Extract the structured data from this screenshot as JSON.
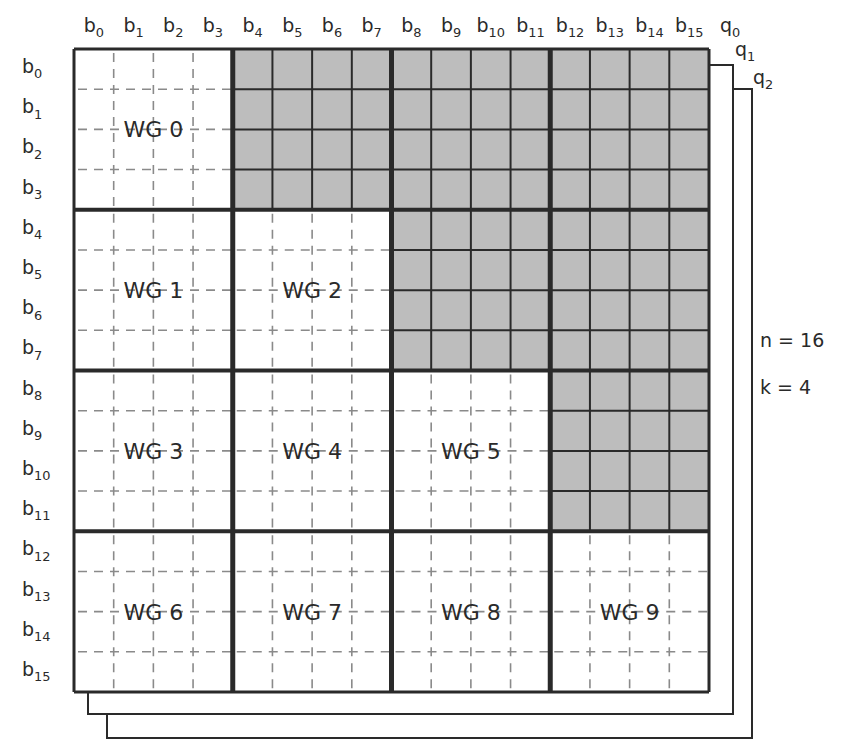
{
  "diagram": {
    "n": 16,
    "k": 4,
    "params": {
      "n_label": "n = 16",
      "k_label": "k = 4"
    },
    "column_labels": [
      "b0",
      "b1",
      "b2",
      "b3",
      "b4",
      "b5",
      "b6",
      "b7",
      "b8",
      "b9",
      "b10",
      "b11",
      "b12",
      "b13",
      "b14",
      "b15"
    ],
    "row_labels": [
      "b0",
      "b1",
      "b2",
      "b3",
      "b4",
      "b5",
      "b6",
      "b7",
      "b8",
      "b9",
      "b10",
      "b11",
      "b12",
      "b13",
      "b14",
      "b15"
    ],
    "layers": [
      {
        "label": "q0",
        "sub": "0"
      },
      {
        "label": "q1",
        "sub": "1"
      },
      {
        "label": "q2",
        "sub": "2"
      }
    ],
    "workgroups": [
      {
        "label": "WG 0",
        "block_row": 0,
        "block_col": 0
      },
      {
        "label": "WG 1",
        "block_row": 1,
        "block_col": 0
      },
      {
        "label": "WG 2",
        "block_row": 1,
        "block_col": 1
      },
      {
        "label": "WG 3",
        "block_row": 2,
        "block_col": 0
      },
      {
        "label": "WG 4",
        "block_row": 2,
        "block_col": 1
      },
      {
        "label": "WG 5",
        "block_row": 2,
        "block_col": 2
      },
      {
        "label": "WG 6",
        "block_row": 3,
        "block_col": 0
      },
      {
        "label": "WG 7",
        "block_row": 3,
        "block_col": 1
      },
      {
        "label": "WG 8",
        "block_row": 3,
        "block_col": 2
      },
      {
        "label": "WG 9",
        "block_row": 3,
        "block_col": 3
      }
    ],
    "shaded_blocks_note": "upper triangle blocks (block_col > block_row) are shaded / unused",
    "colors": {
      "shaded": "#bdbdbd",
      "line": "#2a2a2a",
      "dashed": "#8a8a8a",
      "background": "#ffffff"
    }
  }
}
